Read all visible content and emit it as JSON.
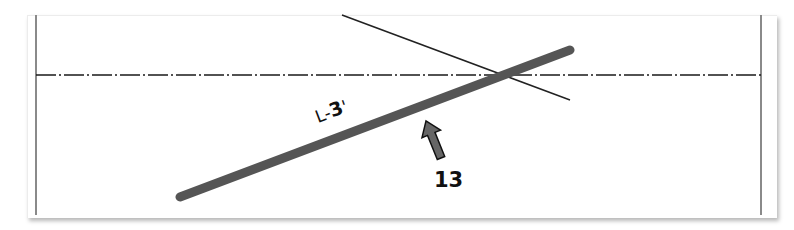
{
  "diagram": {
    "title": "",
    "colors": {
      "background": "#ffffff",
      "frame_border": "#ececec",
      "wall_line": "#8a8a8a",
      "centerline": "#1a1a1a",
      "thin_line": "#222222",
      "member_bar": "#555555",
      "arrow_fill": "#666666",
      "arrow_stroke": "#111111",
      "text": "#111111"
    },
    "elements": {
      "left_wall": {
        "x1": 36,
        "y1": 15,
        "x2": 36,
        "y2": 215
      },
      "right_wall": {
        "x1": 761,
        "y1": 15,
        "x2": 761,
        "y2": 215
      },
      "centerline": {
        "x1": 36,
        "y1": 75,
        "x2": 761,
        "y2": 75,
        "style": "dash-dot"
      },
      "thin_line": {
        "x1": 342,
        "y1": 15,
        "x2": 570,
        "y2": 100
      },
      "member_bar": {
        "x1": 180,
        "y1": 197,
        "x2": 570,
        "y2": 50,
        "width": 9
      }
    },
    "member_label": {
      "prefix": "L-",
      "number": "3",
      "suffix": "'"
    },
    "callout": {
      "text": "13",
      "arrow": "arrow-up-left"
    }
  }
}
